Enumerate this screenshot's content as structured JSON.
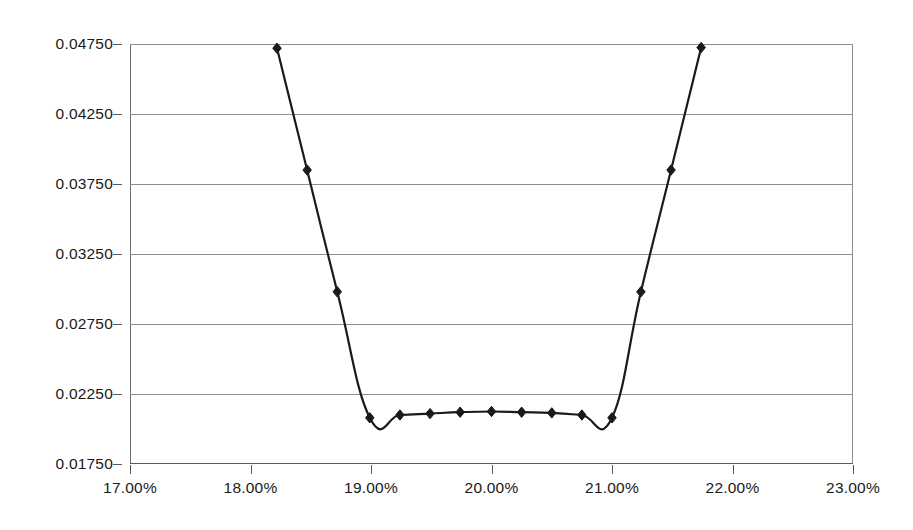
{
  "chart_data": {
    "type": "line",
    "title": "",
    "subtitle": "",
    "xlabel": "",
    "ylabel": "",
    "xlim": [
      17.0,
      23.0
    ],
    "ylim": [
      0.0175,
      0.0475
    ],
    "grid": true,
    "legend": false,
    "legend_position": "none",
    "marker": "diamond",
    "line_color": "#1a1a1a",
    "marker_color": "#1a1a1a",
    "grid_color": "#8e8e8e",
    "x_tick_labels": [
      "17.00%",
      "18.00%",
      "19.00%",
      "20.00%",
      "21.00%",
      "22.00%",
      "23.00%"
    ],
    "x_tick_values": [
      17.0,
      18.0,
      19.0,
      20.0,
      21.0,
      22.0,
      23.0
    ],
    "y_tick_labels": [
      "0.04750",
      "0.04250",
      "0.03750",
      "0.03250",
      "0.02750",
      "0.02250",
      "0.01750"
    ],
    "y_tick_values": [
      0.0475,
      0.0425,
      0.0375,
      0.0325,
      0.0275,
      0.0225,
      0.0175
    ],
    "series": [
      {
        "name": "series-1",
        "x": [
          18.22,
          18.47,
          18.72,
          18.99,
          19.24,
          19.49,
          19.74,
          20.0,
          20.25,
          20.5,
          20.75,
          21.0,
          21.24,
          21.49,
          21.74
        ],
        "y": [
          0.0472,
          0.0385,
          0.0298,
          0.0208,
          0.021,
          0.0211,
          0.0212,
          0.02125,
          0.0212,
          0.02115,
          0.021,
          0.0208,
          0.0298,
          0.0385,
          0.04725
        ]
      }
    ]
  }
}
